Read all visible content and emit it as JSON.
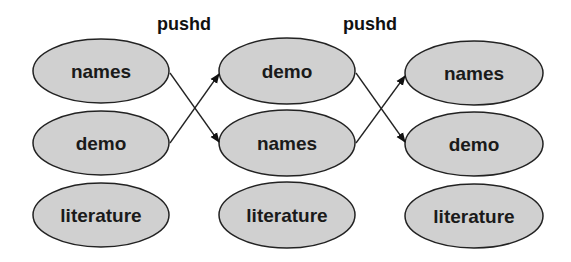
{
  "diagram": {
    "operations": [
      {
        "label": "pushd",
        "x": 184,
        "y": 30
      },
      {
        "label": "pushd",
        "x": 370,
        "y": 30
      }
    ],
    "columns": [
      {
        "cx": 101,
        "stack": [
          "names",
          "demo",
          "literature"
        ]
      },
      {
        "cx": 287,
        "stack": [
          "demo",
          "names",
          "literature"
        ]
      },
      {
        "cx": 474,
        "stack": [
          "names",
          "demo",
          "literature"
        ]
      }
    ],
    "row_cy": [
      71,
      143,
      215
    ],
    "ellipse": {
      "rx": 68,
      "ry": 32,
      "fill": "#d0d0d0",
      "stroke": "#222222"
    },
    "arrows": [
      {
        "from": [
          170,
          71
        ],
        "to": [
          220,
          143
        ]
      },
      {
        "from": [
          170,
          143
        ],
        "to": [
          220,
          71
        ]
      },
      {
        "from": [
          355,
          71
        ],
        "to": [
          406,
          143
        ]
      },
      {
        "from": [
          355,
          143
        ],
        "to": [
          406,
          71
        ]
      }
    ]
  }
}
